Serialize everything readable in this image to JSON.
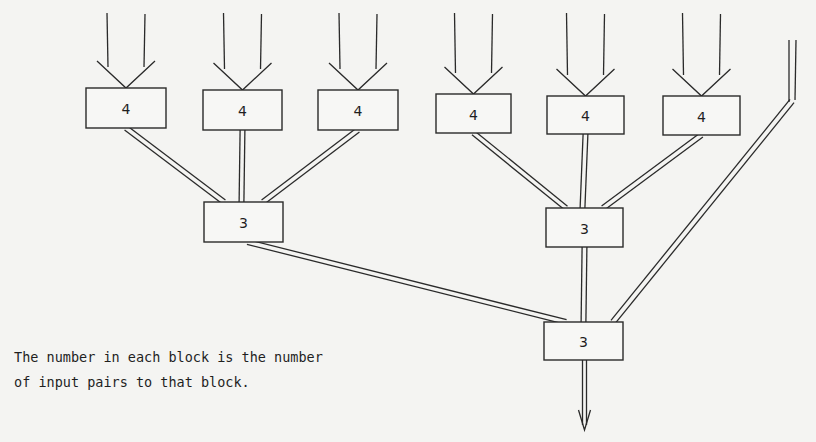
{
  "diagram": {
    "type": "tree-of-blocks",
    "blocks": [
      {
        "id": "top-1",
        "level": "input",
        "label": "4"
      },
      {
        "id": "top-2",
        "level": "input",
        "label": "4"
      },
      {
        "id": "top-3",
        "level": "input",
        "label": "4"
      },
      {
        "id": "top-4",
        "level": "input",
        "label": "4"
      },
      {
        "id": "top-5",
        "level": "input",
        "label": "4"
      },
      {
        "id": "top-6",
        "level": "input",
        "label": "4"
      },
      {
        "id": "mid-left",
        "level": "intermediate",
        "label": "3"
      },
      {
        "id": "mid-right",
        "level": "intermediate",
        "label": "3"
      },
      {
        "id": "bottom",
        "level": "output",
        "label": "3"
      }
    ],
    "connections": [
      {
        "from": "top-1",
        "to": "mid-left"
      },
      {
        "from": "top-2",
        "to": "mid-left"
      },
      {
        "from": "top-3",
        "to": "mid-left"
      },
      {
        "from": "top-4",
        "to": "mid-right"
      },
      {
        "from": "top-5",
        "to": "mid-right"
      },
      {
        "from": "top-6",
        "to": "mid-right"
      },
      {
        "from": "mid-left",
        "to": "bottom"
      },
      {
        "from": "mid-right",
        "to": "bottom"
      },
      {
        "from": "external-input",
        "to": "bottom"
      }
    ],
    "caption": {
      "line1": "The number in each block is the number",
      "line2": "of input pairs to that block."
    }
  }
}
